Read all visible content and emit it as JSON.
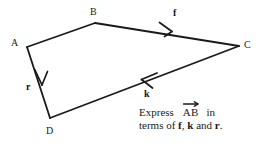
{
  "figure": {
    "type": "vector-quadrilateral-diagram",
    "vertices": [
      {
        "name": "A",
        "label": "A",
        "x": 27,
        "y": 47
      },
      {
        "name": "B",
        "label": "B",
        "x": 95,
        "y": 23
      },
      {
        "name": "C",
        "label": "C",
        "x": 239,
        "y": 46
      },
      {
        "name": "D",
        "label": "D",
        "x": 50,
        "y": 118
      }
    ],
    "edges": [
      {
        "name": "edge-AB",
        "from": "A",
        "to": "B",
        "arrow": false,
        "vector_label": ""
      },
      {
        "name": "edge-BC",
        "from": "B",
        "to": "C",
        "arrow": true,
        "arrow_direction": "B-to-C",
        "vector_label": "f"
      },
      {
        "name": "edge-CD",
        "from": "C",
        "to": "D",
        "arrow": true,
        "arrow_direction": "C-to-D",
        "vector_label": "k"
      },
      {
        "name": "edge-AD",
        "from": "A",
        "to": "D",
        "arrow": true,
        "arrow_direction": "A-to-D",
        "vector_label": "r"
      }
    ],
    "vector_labels": {
      "f": "f",
      "k": "k",
      "r": "r"
    },
    "stroke_color": "#1a1a1a",
    "stroke_width": 1.8
  },
  "question": {
    "line1_prefix": "Express",
    "vector_term": "AB",
    "line1_suffix": "in",
    "line2_prefix": "terms of",
    "vector_f": "f",
    "comma": ",",
    "vector_k": "k",
    "conjunction": "and",
    "vector_r": "r",
    "period": "."
  }
}
